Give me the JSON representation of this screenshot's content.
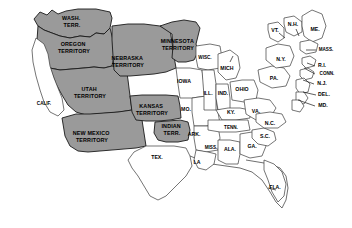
{
  "map": {
    "title": "United States territorial map, mid-1850s",
    "background_color": "#ffffff",
    "territory_fill": "#9a9a9a",
    "state_fill": "#ffffff",
    "border_color": "#1a1a1a",
    "legend_note": "Shaded gray areas are organized territories; white areas are states."
  },
  "territories": [
    {
      "id": "wash",
      "label": "WASH.\nTERR.",
      "line1": "WASH.",
      "line2": "TERR.",
      "x": 72,
      "y": 22,
      "fill": "#9a9a9a"
    },
    {
      "id": "oregon",
      "label": "OREGON\nTERRITORY",
      "line1": "OREGON",
      "line2": "TERRITORY",
      "x": 74,
      "y": 48,
      "fill": "#9a9a9a"
    },
    {
      "id": "utah",
      "label": "UTAH\nTERRITORY",
      "line1": "UTAH",
      "line2": "TERRITORY",
      "x": 90,
      "y": 93,
      "fill": "#9a9a9a"
    },
    {
      "id": "newmex",
      "label": "NEW MEXICO\nTERRITORY",
      "line1": "NEW MEXICO",
      "line2": "TERRITORY",
      "x": 92,
      "y": 137,
      "fill": "#9a9a9a"
    },
    {
      "id": "nebr",
      "label": "NEBRASKA\nTERRITORY",
      "line1": "NEBRASKA",
      "line2": "TERRITORY",
      "x": 128,
      "y": 62,
      "fill": "#9a9a9a"
    },
    {
      "id": "kansas",
      "label": "KANSAS\nTERRITORY",
      "line1": "KANSAS",
      "line2": "TERRITORY",
      "x": 152,
      "y": 110,
      "fill": "#9a9a9a"
    },
    {
      "id": "minn",
      "label": "MINNESOTA\nTERRITORY",
      "line1": "MINNESOTA",
      "line2": "TERRITORY",
      "x": 178,
      "y": 45,
      "fill": "#9a9a9a"
    },
    {
      "id": "indian",
      "label": "INDIAN\nTERR.",
      "line1": "INDIAN",
      "line2": "TERR.",
      "x": 172,
      "y": 130,
      "fill": "#9a9a9a"
    }
  ],
  "states": [
    {
      "id": "calif",
      "label": "CALIF.",
      "x": 44,
      "y": 104
    },
    {
      "id": "tex",
      "label": "TEX.",
      "x": 157,
      "y": 158
    },
    {
      "id": "iowa",
      "label": "IOWA",
      "x": 184,
      "y": 82
    },
    {
      "id": "mo",
      "label": "MO.",
      "x": 186,
      "y": 110
    },
    {
      "id": "ark",
      "label": "ARK.",
      "x": 194,
      "y": 135
    },
    {
      "id": "la",
      "label": "LA",
      "x": 197,
      "y": 163
    },
    {
      "id": "wisc",
      "label": "WISC.",
      "x": 205,
      "y": 58
    },
    {
      "id": "ill",
      "label": "ILL.",
      "x": 208,
      "y": 94
    },
    {
      "id": "miss",
      "label": "MISS.",
      "x": 211,
      "y": 148
    },
    {
      "id": "ind",
      "label": "IND.",
      "x": 223,
      "y": 94
    },
    {
      "id": "mich",
      "label": "MICH",
      "x": 227,
      "y": 69
    },
    {
      "id": "ala",
      "label": "ALA.",
      "x": 230,
      "y": 150
    },
    {
      "id": "ky",
      "label": "KY.",
      "x": 231,
      "y": 113
    },
    {
      "id": "tenn",
      "label": "TENN.",
      "x": 231,
      "y": 128
    },
    {
      "id": "ohio",
      "label": "OHIO",
      "x": 242,
      "y": 90
    },
    {
      "id": "ga",
      "label": "GA.",
      "x": 252,
      "y": 147
    },
    {
      "id": "va",
      "label": "VA.",
      "x": 256,
      "y": 112
    },
    {
      "id": "sc",
      "label": "S.C.",
      "x": 265,
      "y": 137
    },
    {
      "id": "nc",
      "label": "N.C.",
      "x": 270,
      "y": 124
    },
    {
      "id": "pa",
      "label": "PA.",
      "x": 274,
      "y": 79
    },
    {
      "id": "fla",
      "label": "FLA.",
      "x": 275,
      "y": 188
    },
    {
      "id": "vt",
      "label": "VT.",
      "x": 275,
      "y": 31
    },
    {
      "id": "ny",
      "label": "N.Y.",
      "x": 281,
      "y": 60
    },
    {
      "id": "nh",
      "label": "N.H.",
      "x": 293,
      "y": 25
    },
    {
      "id": "me",
      "label": "ME.",
      "x": 315,
      "y": 30
    },
    {
      "id": "mass",
      "label": "MASS.",
      "x": 326,
      "y": 50
    },
    {
      "id": "ri",
      "label": "R.I.",
      "x": 322,
      "y": 66
    },
    {
      "id": "conn",
      "label": "CONN.",
      "x": 327,
      "y": 74
    },
    {
      "id": "nj",
      "label": "N.J.",
      "x": 322,
      "y": 84
    },
    {
      "id": "del",
      "label": "DEL.",
      "x": 324,
      "y": 95
    },
    {
      "id": "md",
      "label": "MD.",
      "x": 323,
      "y": 106
    }
  ]
}
